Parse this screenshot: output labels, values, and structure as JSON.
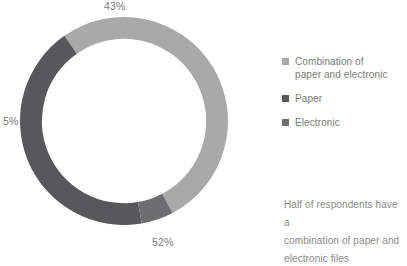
{
  "chart_data": {
    "type": "pie",
    "variant": "donut",
    "title": "",
    "subtitle": "",
    "xlabel": "",
    "ylabel": "",
    "categories": [
      "Combination of paper and electronic",
      "Paper",
      "Electronic"
    ],
    "values": [
      52,
      43,
      5
    ],
    "value_suffix": "%",
    "data_labels": [
      "52%",
      "43%",
      "5%"
    ],
    "colors": [
      "#a9a9a9",
      "#58585a",
      "#6e6e70"
    ],
    "start_angle_deg": -35,
    "direction": "clockwise",
    "inner_radius_ratio": 0.79,
    "grid": false,
    "legend_position": "right",
    "slices": [
      {
        "name": "Combination of paper and electronic",
        "legend_label_line1": "Combination of",
        "legend_label_line2": "paper and electronic",
        "value": 52,
        "data_label": "52%",
        "color": "#a9a9a9",
        "start_angle_deg": -35,
        "sweep_deg": 187.2,
        "label_position": "bottom"
      },
      {
        "name": "Paper",
        "legend_label_line1": "Paper",
        "legend_label_line2": "",
        "value": 43,
        "data_label": "43%",
        "color": "#58585a",
        "start_angle_deg": 170.2,
        "sweep_deg": 154.8,
        "label_position": "top"
      },
      {
        "name": "Electronic",
        "legend_label_line1": "Electronic",
        "legend_label_line2": "",
        "value": 5,
        "data_label": "5%",
        "color": "#6e6e70",
        "start_angle_deg": 152.2,
        "sweep_deg": 18.0,
        "label_position": "left"
      }
    ],
    "annotations": [
      "Half of respondents have a",
      "combination of paper and",
      "electronic files"
    ]
  },
  "labels": {
    "top": "43%",
    "left": "5%",
    "bottom": "52%"
  },
  "legend": {
    "items": [
      {
        "line1": "Combination of",
        "line2": "paper and electronic",
        "color": "#a9a9a9",
        "swatch_name": "legend-swatch-combination"
      },
      {
        "line1": "Paper",
        "line2": "",
        "color": "#58585a",
        "swatch_name": "legend-swatch-paper"
      },
      {
        "line1": "Electronic",
        "line2": "",
        "color": "#6e6e70",
        "swatch_name": "legend-swatch-electronic"
      }
    ]
  },
  "caption": {
    "line1": "Half of respondents have a",
    "line2": "combination of paper and",
    "line3": "electronic files"
  },
  "colors": {
    "background": "#ffffff",
    "text": "#7c7c7c",
    "label_text": "#7a7a7a",
    "caption_text": "#8a8a8a",
    "combination": "#a9a9a9",
    "paper": "#58585a",
    "electronic": "#6e6e70"
  }
}
